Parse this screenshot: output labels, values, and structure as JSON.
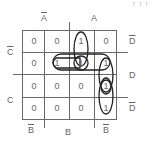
{
  "top_fragment": "r r r",
  "labels": {
    "col_top": [
      {
        "text": "A",
        "overline": true
      },
      {
        "text": "A",
        "overline": false
      }
    ],
    "col_bottom": [
      {
        "text": "B",
        "overline": true
      },
      {
        "text": "B",
        "overline": false
      },
      {
        "text": "B",
        "overline": true
      }
    ],
    "row_left": [
      {
        "text": "C",
        "overline": true
      },
      {
        "text": "C",
        "overline": false
      }
    ],
    "row_right": [
      {
        "text": "D",
        "overline": true
      },
      {
        "text": "D",
        "overline": false
      },
      {
        "text": "D",
        "overline": true
      }
    ]
  },
  "grid": {
    "rows": [
      [
        "0",
        "0",
        "1",
        "0"
      ],
      [
        "0",
        "1",
        "1",
        "1"
      ],
      [
        "0",
        "0",
        "0",
        "1"
      ],
      [
        "0",
        "0",
        "0",
        "1"
      ]
    ]
  },
  "groupings": [
    {
      "name": "col3-rows1-2",
      "cells": [
        [
          0,
          2
        ],
        [
          1,
          2
        ]
      ]
    },
    {
      "name": "row2-cols2-4",
      "cells": [
        [
          1,
          1
        ],
        [
          1,
          2
        ],
        [
          1,
          3
        ]
      ]
    },
    {
      "name": "row2-cols2-3",
      "cells": [
        [
          1,
          1
        ],
        [
          1,
          2
        ]
      ]
    },
    {
      "name": "single-row2-col3",
      "cells": [
        [
          1,
          2
        ]
      ]
    },
    {
      "name": "col4-rows2-3",
      "cells": [
        [
          1,
          3
        ],
        [
          2,
          3
        ]
      ]
    },
    {
      "name": "col4-rows3-4",
      "cells": [
        [
          2,
          3
        ],
        [
          3,
          3
        ]
      ]
    }
  ],
  "colors": {
    "grid_line": "#6a6a6a",
    "loop": "#222222",
    "text": "#666666"
  }
}
